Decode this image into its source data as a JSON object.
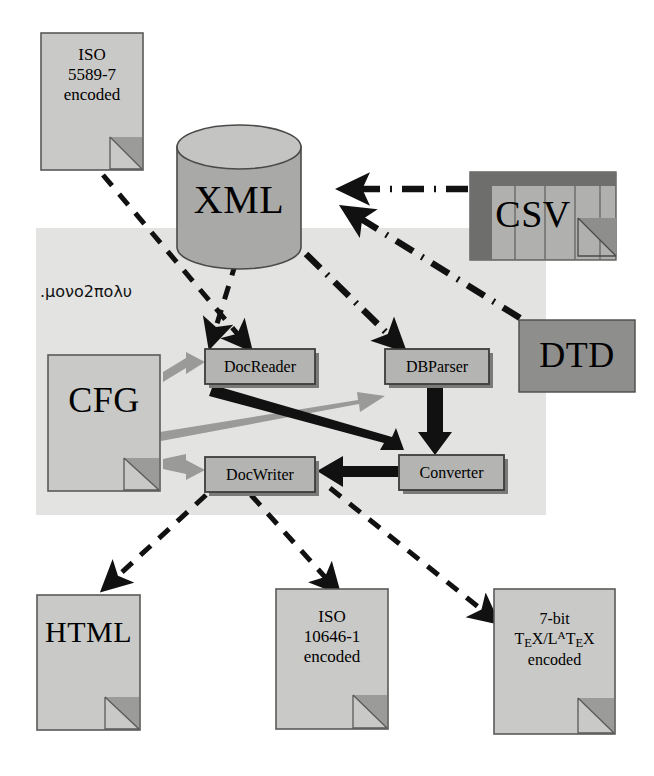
{
  "diagram": {
    "colors": {
      "panel_bg": "#e3e3e1",
      "doc_fill": "#c9c9c7",
      "doc_stroke": "#5a5a58",
      "fold_fill": "#9b9b99",
      "proc_fill": "#b4b4b2",
      "proc_stroke": "#3c3c3a",
      "db_fill": "#a9a9a7",
      "db_top_fill": "#c4c4c2",
      "dtd_fill": "#8e8e8c",
      "csv_fill": "#b0b0ae",
      "csv_header_fill": "#6e6e6c",
      "arrow_black": "#111111",
      "arrow_gray": "#9a9a98",
      "background": "#ffffff"
    },
    "panel": {
      "name": "processing-area",
      "label": ".μονο2πολυ"
    },
    "nodes": {
      "iso5589": {
        "line1": "ISO",
        "line2": "5589-7",
        "line3": "encoded",
        "type": "document"
      },
      "xml": {
        "label": "XML",
        "type": "database"
      },
      "csv": {
        "label": "CSV",
        "type": "table"
      },
      "dtd": {
        "label": "DTD",
        "type": "box"
      },
      "cfg": {
        "label": "CFG",
        "type": "document"
      },
      "docreader": {
        "label": "DocReader",
        "type": "process"
      },
      "dbparser": {
        "label": "DBParser",
        "type": "process"
      },
      "docwriter": {
        "label": "DocWriter",
        "type": "process"
      },
      "converter": {
        "label": "Converter",
        "type": "process"
      },
      "html": {
        "label": "HTML",
        "type": "document"
      },
      "iso10646": {
        "line1": "ISO",
        "line2": "10646-1",
        "line3": "encoded",
        "type": "document"
      },
      "tex": {
        "line1": "7-bit",
        "line2_pre": "T",
        "line2_e": "E",
        "line2_mid": "X/L",
        "line2_a": "A",
        "line2_t": "T",
        "line2_e2": "E",
        "line2_x": "X",
        "line3": "encoded",
        "type": "document"
      }
    },
    "edges": [
      {
        "name": "iso5589-to-docreader",
        "from": "iso5589",
        "to": "docreader",
        "style": "dashed",
        "color": "#111111"
      },
      {
        "name": "xml-to-docreader",
        "from": "xml",
        "to": "docreader",
        "style": "dashed",
        "color": "#111111"
      },
      {
        "name": "xml-to-dbparser",
        "from": "xml",
        "to": "dbparser",
        "style": "dash-dot",
        "color": "#111111"
      },
      {
        "name": "csv-to-xml",
        "from": "csv",
        "to": "xml",
        "style": "dash-dot",
        "color": "#111111"
      },
      {
        "name": "dtd-to-xml",
        "from": "dtd",
        "to": "xml",
        "style": "dash-dot",
        "color": "#111111"
      },
      {
        "name": "cfg-to-docreader",
        "from": "cfg",
        "to": "docreader",
        "style": "solid",
        "color": "#9a9a98"
      },
      {
        "name": "cfg-to-dbparser",
        "from": "cfg",
        "to": "dbparser",
        "style": "solid",
        "color": "#9a9a98"
      },
      {
        "name": "cfg-to-docwriter",
        "from": "cfg",
        "to": "docwriter",
        "style": "solid",
        "color": "#9a9a98"
      },
      {
        "name": "docreader-to-converter",
        "from": "docreader",
        "to": "converter",
        "style": "solid",
        "color": "#111111"
      },
      {
        "name": "dbparser-to-converter",
        "from": "dbparser",
        "to": "converter",
        "style": "solid",
        "color": "#111111"
      },
      {
        "name": "converter-to-docwriter",
        "from": "converter",
        "to": "docwriter",
        "style": "solid",
        "color": "#111111"
      },
      {
        "name": "docwriter-to-html",
        "from": "docwriter",
        "to": "html",
        "style": "dashed",
        "color": "#111111"
      },
      {
        "name": "docwriter-to-iso10646",
        "from": "docwriter",
        "to": "iso10646",
        "style": "dashed",
        "color": "#111111"
      },
      {
        "name": "docwriter-to-tex",
        "from": "docwriter",
        "to": "tex",
        "style": "dashed",
        "color": "#111111"
      }
    ]
  }
}
